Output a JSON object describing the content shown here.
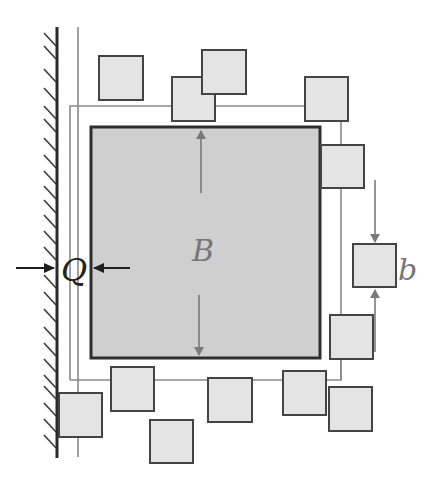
{
  "diagram": {
    "colors": {
      "background": "#ffffff",
      "wall": "#2a2a2a",
      "hatch": "#3a3a3a",
      "big_square_fill": "#cfcfcf",
      "big_square_stroke": "#2e2e2e",
      "small_square_fill": "#e4e4e4",
      "small_square_stroke": "#444444",
      "frame_line": "#8a8a8a",
      "arrow_gray": "#7a7a7a",
      "arrow_black": "#1e1e1e",
      "label_gray": "#777777",
      "label_dark": "#222222"
    },
    "labels": {
      "big_dimension": "B",
      "gap": "Q",
      "particle_size": "b"
    },
    "big_square": {
      "x": 91,
      "y": 127,
      "w": 229,
      "h": 231
    },
    "small_squares": [
      {
        "x": 99,
        "y": 56,
        "s": 44
      },
      {
        "x": 172,
        "y": 77,
        "s": 43
      },
      {
        "x": 202,
        "y": 50,
        "s": 44
      },
      {
        "x": 305,
        "y": 77,
        "s": 43
      },
      {
        "x": 321,
        "y": 145,
        "s": 43
      },
      {
        "x": 353,
        "y": 244,
        "s": 43
      },
      {
        "x": 330,
        "y": 315,
        "s": 43
      },
      {
        "x": 283,
        "y": 371,
        "s": 43
      },
      {
        "x": 329,
        "y": 387,
        "s": 43
      },
      {
        "x": 208,
        "y": 378,
        "s": 44
      },
      {
        "x": 111,
        "y": 367,
        "s": 43
      },
      {
        "x": 150,
        "y": 420,
        "s": 43
      },
      {
        "x": 59,
        "y": 393,
        "s": 43
      }
    ]
  }
}
